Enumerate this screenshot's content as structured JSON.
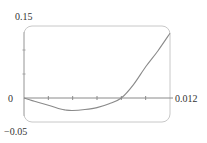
{
  "chart_data": {
    "type": "line",
    "title": "",
    "xlabel": "",
    "ylabel": "",
    "xlim": [
      0,
      0.012
    ],
    "ylim": [
      -0.05,
      0.15
    ],
    "grid": false,
    "legend": null,
    "x_ticks": [
      0,
      0.002,
      0.004,
      0.006,
      0.008,
      0.01,
      0.012
    ],
    "y_ticks": [
      -0.05,
      0,
      0.05,
      0.1,
      0.15
    ],
    "tick_labels": {
      "x_max": "0.012",
      "y_max": "0.15",
      "y_zero": "0",
      "y_min": "−0.05"
    },
    "series": [
      {
        "name": "curve",
        "x": [
          0,
          0.001,
          0.002,
          0.003,
          0.0034,
          0.004,
          0.005,
          0.006,
          0.007,
          0.008,
          0.009,
          0.01,
          0.011,
          0.012
        ],
        "y": [
          0,
          -0.008,
          -0.015,
          -0.023,
          -0.025,
          -0.026,
          -0.024,
          -0.02,
          -0.012,
          0,
          0.028,
          0.065,
          0.098,
          0.135
        ]
      }
    ],
    "colors": {
      "curve": "#8a8a8a",
      "axis": "#8a8a8a",
      "frame": "#c8c8c8",
      "text": "#333333"
    }
  }
}
